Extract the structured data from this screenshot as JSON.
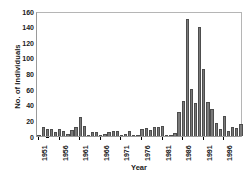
{
  "chart_data": {
    "type": "bar",
    "title": "",
    "xlabel": "Year",
    "ylabel": "No. of Individuals",
    "ylim": [
      0,
      160
    ],
    "ytick_step": 20,
    "yticks": [
      0,
      20,
      40,
      60,
      80,
      100,
      120,
      140,
      160
    ],
    "ytick_labels": [
      "0",
      "20",
      "40",
      "60",
      "80",
      "100",
      "120",
      "140",
      "160"
    ],
    "xlim": [
      1950.5,
      2000.5
    ],
    "xtick_labels": [
      "1951",
      "1956",
      "1961",
      "1966",
      "1971",
      "1976",
      "1981",
      "1986",
      "1991",
      "1996"
    ],
    "xticks": [
      1951,
      1956,
      1961,
      1966,
      1971,
      1976,
      1981,
      1986,
      1991,
      1996
    ],
    "grid": false,
    "legend": null,
    "bar_color": "#7a7a7a",
    "bar_edge_color": "#4d4d4d",
    "categories": [
      "1951",
      "1952",
      "1953",
      "1954",
      "1955",
      "1956",
      "1957",
      "1958",
      "1959",
      "1960",
      "1961",
      "1962",
      "1963",
      "1964",
      "1965",
      "1966",
      "1967",
      "1968",
      "1969",
      "1970",
      "1971",
      "1972",
      "1973",
      "1974",
      "1975",
      "1976",
      "1977",
      "1978",
      "1979",
      "1980",
      "1981",
      "1982",
      "1983",
      "1984",
      "1985",
      "1986",
      "1987",
      "1988",
      "1989",
      "1990",
      "1991",
      "1992",
      "1993",
      "1994",
      "1995",
      "1996",
      "1997",
      "1998",
      "1999",
      "2000"
    ],
    "values": [
      0,
      11,
      9,
      9,
      5,
      9,
      7,
      2,
      8,
      11,
      24,
      13,
      1,
      5,
      5,
      1,
      2,
      5,
      7,
      7,
      1,
      3,
      6,
      0,
      1,
      9,
      10,
      8,
      11,
      11,
      13,
      1,
      0,
      4,
      31,
      45,
      150,
      60,
      42,
      140,
      86,
      44,
      34,
      17,
      9,
      25,
      7,
      11,
      10,
      15
    ]
  }
}
